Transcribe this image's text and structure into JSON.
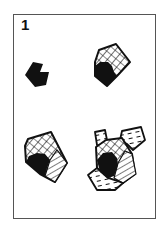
{
  "figure": {
    "panel_number": "1",
    "stages": [
      {
        "id": "stage-1",
        "description": "solid black core polygon"
      },
      {
        "id": "stage-2",
        "description": "black core with cross-hatched region added"
      },
      {
        "id": "stage-3",
        "description": "black core, cross-hatched region, and line-hatched region"
      },
      {
        "id": "stage-4",
        "description": "core with cross-hatched, line-hatched and dashed-fill regions extending outward"
      }
    ],
    "colors": {
      "ink": "#111111",
      "frame": "#555555",
      "background": "#ffffff"
    }
  }
}
